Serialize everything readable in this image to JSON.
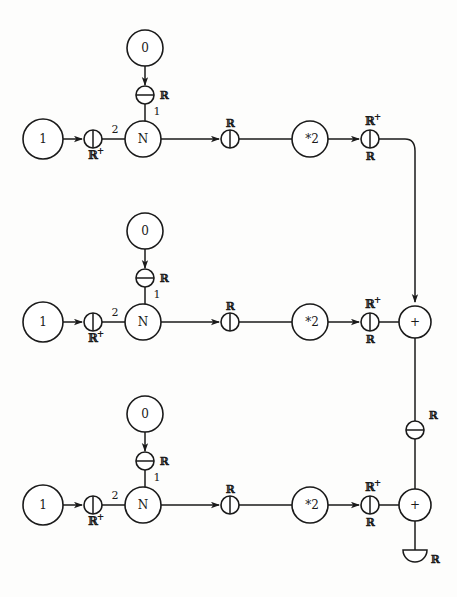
{
  "diagram": {
    "type": "dataflow-network",
    "stroke_color": "#1a1a1a",
    "background_color": "#fdfdfc",
    "node_fill": "#ffffff",
    "symbols": {
      "circle_vertical_bar": "gate with vertical divider",
      "circle_horizontal_bar": "gate with horizontal divider",
      "half_disc": "output sink terminal"
    },
    "labels": {
      "const_one": "1",
      "const_zero": "0",
      "node_n": "N",
      "node_pow": "*2",
      "adder": "+",
      "real": "ℝ",
      "real_plus": "ℝ",
      "plus_sup": "+",
      "port_one": "1",
      "port_two": "2"
    },
    "rows": [
      {
        "id": "row-1",
        "y": 139,
        "const_source": "1",
        "const_top": "0",
        "top_gate_label": "ℝ",
        "in_gate_label": "ℝ",
        "in_gate_sup": "+",
        "n_label": "N",
        "n_port_top": "1",
        "n_port_left": "2",
        "mid_gate_label": "ℝ",
        "pow_label": "*2",
        "out_gate_top": "ℝ",
        "out_gate_top_sup": "+",
        "out_gate_bottom": "ℝ"
      },
      {
        "id": "row-2",
        "y": 322,
        "const_source": "1",
        "const_top": "0",
        "top_gate_label": "ℝ",
        "in_gate_label": "ℝ",
        "in_gate_sup": "+",
        "n_label": "N",
        "n_port_top": "1",
        "n_port_left": "2",
        "mid_gate_label": "ℝ",
        "pow_label": "*2",
        "out_gate_top": "ℝ",
        "out_gate_top_sup": "+",
        "out_gate_bottom": "ℝ"
      },
      {
        "id": "row-3",
        "y": 505,
        "const_source": "1",
        "const_top": "0",
        "top_gate_label": "ℝ",
        "in_gate_label": "ℝ",
        "in_gate_sup": "+",
        "n_label": "N",
        "n_port_top": "1",
        "n_port_left": "2",
        "mid_gate_label": "ℝ",
        "pow_label": "*2",
        "out_gate_top": "ℝ",
        "out_gate_top_sup": "+",
        "out_gate_bottom": "ℝ"
      }
    ],
    "adders": [
      {
        "id": "adder-1",
        "label": "+",
        "x": 415,
        "y": 322
      },
      {
        "id": "adder-2",
        "label": "+",
        "x": 415,
        "y": 505
      }
    ],
    "link_gate": {
      "label": "ℝ",
      "x": 415,
      "y": 430
    },
    "sink": {
      "label": "ℝ",
      "x": 415,
      "y": 560
    }
  }
}
